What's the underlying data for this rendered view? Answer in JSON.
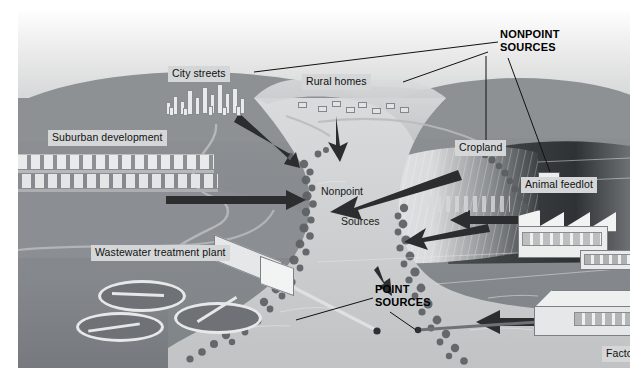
{
  "figure": {
    "type": "illustrated diagram"
  },
  "headings": {
    "nonpoint_sources": "NONPOINT\nSOURCES",
    "point_sources": "POINT\nSOURCES"
  },
  "river_text": {
    "line1": "Nonpoint",
    "line2": "Sources"
  },
  "labels": {
    "city_streets": "City streets",
    "rural_homes": "Rural homes",
    "suburban_development": "Suburban development",
    "cropland": "Cropland",
    "animal_feedlot": "Animal feedlot",
    "wastewater_treatment_plant": "Wastewater treatment plant",
    "factory": "Factory"
  },
  "colors": {
    "label_background": "#d4d6d7",
    "label_text": "#111111",
    "sky_top": "#fdfdfd",
    "sky_bottom": "#c6c8ca",
    "hill_far": "#a7abae",
    "ground": "#8a8e92",
    "river": "#c9cbcc",
    "arrow": "#2b2d2f",
    "building": "#e9eaeb"
  },
  "caption": ""
}
